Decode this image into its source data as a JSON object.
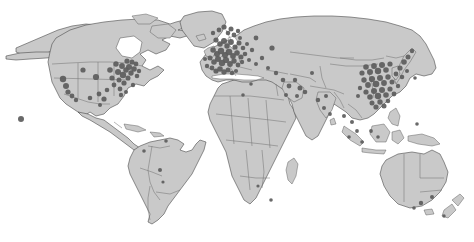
{
  "figure": {
    "type": "dot-distribution-world-map",
    "title": "",
    "caption": "",
    "width": 474,
    "height": 242,
    "projection": "robinson-like",
    "colors": {
      "ocean": "#ffffff",
      "land": "#c9c9c9",
      "country_border": "#6e6e6e",
      "coastline": "#4a4a4a",
      "marker": "#5c5c5c"
    },
    "legend": {
      "visible": false,
      "entries": []
    },
    "axes": {
      "visible": false
    },
    "labels": []
  },
  "chart_data": {
    "type": "scatter",
    "title": "",
    "subtitle": "",
    "xlabel": "Longitude",
    "ylabel": "Latitude",
    "xlim": [
      -180,
      180
    ],
    "ylim": [
      -90,
      90
    ],
    "grid": false,
    "legend_position": "none",
    "marker_style": {
      "shape": "circle",
      "color": "#5c5c5c",
      "opacity": 0.92
    },
    "regions": [
      {
        "name": "Western Europe",
        "density": "very-high",
        "approx_count": 120
      },
      {
        "name": "East Asia",
        "density": "very-high",
        "approx_count": 85
      },
      {
        "name": "United States",
        "density": "high",
        "approx_count": 55
      },
      {
        "name": "Middle East",
        "density": "low",
        "approx_count": 8
      },
      {
        "name": "South Asia",
        "density": "low",
        "approx_count": 6
      },
      {
        "name": "Southeast Asia",
        "density": "low",
        "approx_count": 7
      },
      {
        "name": "Australia / Oceania",
        "density": "low",
        "approx_count": 4
      },
      {
        "name": "South America",
        "density": "very-low",
        "approx_count": 4
      },
      {
        "name": "Africa",
        "density": "very-low",
        "approx_count": 3
      },
      {
        "name": "Russia",
        "density": "very-low",
        "approx_count": 2
      }
    ],
    "points": [
      {
        "x": 21,
        "y": 119,
        "r": 3.0
      },
      {
        "x": 63,
        "y": 79,
        "r": 3.2
      },
      {
        "x": 66,
        "y": 86,
        "r": 3.0
      },
      {
        "x": 68,
        "y": 92,
        "r": 2.6
      },
      {
        "x": 72,
        "y": 96,
        "r": 2.4
      },
      {
        "x": 76,
        "y": 100,
        "r": 2.2
      },
      {
        "x": 83,
        "y": 70,
        "r": 2.6
      },
      {
        "x": 90,
        "y": 98,
        "r": 2.3
      },
      {
        "x": 96,
        "y": 77,
        "r": 3.1
      },
      {
        "x": 99,
        "y": 94,
        "r": 2.4
      },
      {
        "x": 104,
        "y": 99,
        "r": 2.6
      },
      {
        "x": 107,
        "y": 90,
        "r": 2.3
      },
      {
        "x": 110,
        "y": 70,
        "r": 2.8
      },
      {
        "x": 112,
        "y": 78,
        "r": 2.6
      },
      {
        "x": 114,
        "y": 85,
        "r": 2.4
      },
      {
        "x": 116,
        "y": 64,
        "r": 2.7
      },
      {
        "x": 118,
        "y": 72,
        "r": 3.0
      },
      {
        "x": 119,
        "y": 80,
        "r": 2.5
      },
      {
        "x": 120,
        "y": 89,
        "r": 2.4
      },
      {
        "x": 122,
        "y": 66,
        "r": 2.9
      },
      {
        "x": 123,
        "y": 75,
        "r": 3.2
      },
      {
        "x": 124,
        "y": 83,
        "r": 2.6
      },
      {
        "x": 126,
        "y": 70,
        "r": 2.8
      },
      {
        "x": 127,
        "y": 61,
        "r": 2.6
      },
      {
        "x": 128,
        "y": 78,
        "r": 2.5
      },
      {
        "x": 129,
        "y": 67,
        "r": 3.0
      },
      {
        "x": 131,
        "y": 73,
        "r": 2.7
      },
      {
        "x": 132,
        "y": 62,
        "r": 2.5
      },
      {
        "x": 133,
        "y": 85,
        "r": 2.2
      },
      {
        "x": 134,
        "y": 69,
        "r": 2.8
      },
      {
        "x": 136,
        "y": 64,
        "r": 2.4
      },
      {
        "x": 137,
        "y": 76,
        "r": 2.3
      },
      {
        "x": 139,
        "y": 71,
        "r": 2.2
      },
      {
        "x": 121,
        "y": 95,
        "r": 2.2
      },
      {
        "x": 126,
        "y": 92,
        "r": 2.0
      },
      {
        "x": 100,
        "y": 105,
        "r": 2.0
      },
      {
        "x": 144,
        "y": 151,
        "r": 1.8
      },
      {
        "x": 160,
        "y": 170,
        "r": 2.0
      },
      {
        "x": 166,
        "y": 141,
        "r": 1.8
      },
      {
        "x": 163,
        "y": 182,
        "r": 1.6
      },
      {
        "x": 213,
        "y": 33,
        "r": 2.2
      },
      {
        "x": 219,
        "y": 30,
        "r": 2.4
      },
      {
        "x": 224,
        "y": 27,
        "r": 2.6
      },
      {
        "x": 228,
        "y": 33,
        "r": 2.3
      },
      {
        "x": 231,
        "y": 29,
        "r": 2.5
      },
      {
        "x": 234,
        "y": 35,
        "r": 2.4
      },
      {
        "x": 238,
        "y": 31,
        "r": 2.2
      },
      {
        "x": 216,
        "y": 40,
        "r": 2.6
      },
      {
        "x": 220,
        "y": 44,
        "r": 2.8
      },
      {
        "x": 224,
        "y": 41,
        "r": 3.0
      },
      {
        "x": 227,
        "y": 46,
        "r": 2.7
      },
      {
        "x": 231,
        "y": 42,
        "r": 2.9
      },
      {
        "x": 235,
        "y": 47,
        "r": 2.6
      },
      {
        "x": 239,
        "y": 43,
        "r": 2.5
      },
      {
        "x": 243,
        "y": 48,
        "r": 2.3
      },
      {
        "x": 213,
        "y": 50,
        "r": 2.7
      },
      {
        "x": 217,
        "y": 54,
        "r": 3.0
      },
      {
        "x": 221,
        "y": 51,
        "r": 3.2
      },
      {
        "x": 225,
        "y": 55,
        "r": 3.1
      },
      {
        "x": 229,
        "y": 52,
        "r": 3.3
      },
      {
        "x": 233,
        "y": 56,
        "r": 2.9
      },
      {
        "x": 237,
        "y": 53,
        "r": 2.8
      },
      {
        "x": 241,
        "y": 57,
        "r": 2.5
      },
      {
        "x": 245,
        "y": 54,
        "r": 2.3
      },
      {
        "x": 210,
        "y": 58,
        "r": 2.5
      },
      {
        "x": 214,
        "y": 62,
        "r": 2.8
      },
      {
        "x": 218,
        "y": 59,
        "r": 3.0
      },
      {
        "x": 222,
        "y": 63,
        "r": 3.2
      },
      {
        "x": 226,
        "y": 60,
        "r": 3.1
      },
      {
        "x": 230,
        "y": 64,
        "r": 2.9
      },
      {
        "x": 234,
        "y": 61,
        "r": 2.7
      },
      {
        "x": 238,
        "y": 65,
        "r": 2.4
      },
      {
        "x": 242,
        "y": 62,
        "r": 2.2
      },
      {
        "x": 212,
        "y": 68,
        "r": 2.4
      },
      {
        "x": 216,
        "y": 71,
        "r": 2.6
      },
      {
        "x": 220,
        "y": 69,
        "r": 2.8
      },
      {
        "x": 224,
        "y": 72,
        "r": 2.7
      },
      {
        "x": 228,
        "y": 70,
        "r": 2.5
      },
      {
        "x": 232,
        "y": 73,
        "r": 2.3
      },
      {
        "x": 236,
        "y": 71,
        "r": 2.1
      },
      {
        "x": 207,
        "y": 66,
        "r": 2.2
      },
      {
        "x": 205,
        "y": 59,
        "r": 2.0
      },
      {
        "x": 240,
        "y": 38,
        "r": 2.0
      },
      {
        "x": 247,
        "y": 44,
        "r": 2.0
      },
      {
        "x": 252,
        "y": 50,
        "r": 2.2
      },
      {
        "x": 256,
        "y": 38,
        "r": 2.4
      },
      {
        "x": 249,
        "y": 60,
        "r": 2.0
      },
      {
        "x": 256,
        "y": 64,
        "r": 2.0
      },
      {
        "x": 262,
        "y": 58,
        "r": 2.2
      },
      {
        "x": 272,
        "y": 48,
        "r": 2.6
      },
      {
        "x": 268,
        "y": 68,
        "r": 2.0
      },
      {
        "x": 276,
        "y": 73,
        "r": 2.2
      },
      {
        "x": 283,
        "y": 80,
        "r": 2.3
      },
      {
        "x": 289,
        "y": 86,
        "r": 2.4
      },
      {
        "x": 295,
        "y": 80,
        "r": 2.2
      },
      {
        "x": 300,
        "y": 88,
        "r": 2.5
      },
      {
        "x": 305,
        "y": 92,
        "r": 2.3
      },
      {
        "x": 297,
        "y": 96,
        "r": 2.0
      },
      {
        "x": 286,
        "y": 95,
        "r": 2.0
      },
      {
        "x": 312,
        "y": 73,
        "r": 2.0
      },
      {
        "x": 318,
        "y": 100,
        "r": 2.2
      },
      {
        "x": 324,
        "y": 108,
        "r": 2.0
      },
      {
        "x": 330,
        "y": 114,
        "r": 1.9
      },
      {
        "x": 326,
        "y": 96,
        "r": 2.0
      },
      {
        "x": 344,
        "y": 116,
        "r": 2.0
      },
      {
        "x": 352,
        "y": 122,
        "r": 2.0
      },
      {
        "x": 357,
        "y": 131,
        "r": 1.9
      },
      {
        "x": 349,
        "y": 137,
        "r": 1.8
      },
      {
        "x": 362,
        "y": 142,
        "r": 1.8
      },
      {
        "x": 371,
        "y": 131,
        "r": 1.9
      },
      {
        "x": 378,
        "y": 137,
        "r": 1.8
      },
      {
        "x": 362,
        "y": 73,
        "r": 2.6
      },
      {
        "x": 366,
        "y": 67,
        "r": 2.8
      },
      {
        "x": 370,
        "y": 72,
        "r": 3.0
      },
      {
        "x": 374,
        "y": 66,
        "r": 2.9
      },
      {
        "x": 378,
        "y": 71,
        "r": 3.2
      },
      {
        "x": 382,
        "y": 65,
        "r": 3.0
      },
      {
        "x": 386,
        "y": 70,
        "r": 2.8
      },
      {
        "x": 390,
        "y": 64,
        "r": 2.6
      },
      {
        "x": 364,
        "y": 80,
        "r": 2.7
      },
      {
        "x": 368,
        "y": 85,
        "r": 2.9
      },
      {
        "x": 372,
        "y": 79,
        "r": 3.1
      },
      {
        "x": 376,
        "y": 84,
        "r": 3.3
      },
      {
        "x": 380,
        "y": 78,
        "r": 3.0
      },
      {
        "x": 384,
        "y": 83,
        "r": 2.9
      },
      {
        "x": 388,
        "y": 77,
        "r": 2.7
      },
      {
        "x": 392,
        "y": 82,
        "r": 2.5
      },
      {
        "x": 366,
        "y": 92,
        "r": 2.6
      },
      {
        "x": 370,
        "y": 97,
        "r": 2.8
      },
      {
        "x": 374,
        "y": 91,
        "r": 3.0
      },
      {
        "x": 378,
        "y": 96,
        "r": 3.2
      },
      {
        "x": 382,
        "y": 90,
        "r": 3.0
      },
      {
        "x": 386,
        "y": 95,
        "r": 2.8
      },
      {
        "x": 390,
        "y": 89,
        "r": 2.6
      },
      {
        "x": 394,
        "y": 94,
        "r": 2.4
      },
      {
        "x": 372,
        "y": 103,
        "r": 2.5
      },
      {
        "x": 376,
        "y": 107,
        "r": 2.6
      },
      {
        "x": 380,
        "y": 102,
        "r": 2.7
      },
      {
        "x": 384,
        "y": 106,
        "r": 2.5
      },
      {
        "x": 388,
        "y": 101,
        "r": 2.3
      },
      {
        "x": 360,
        "y": 88,
        "r": 2.2
      },
      {
        "x": 358,
        "y": 96,
        "r": 2.0
      },
      {
        "x": 396,
        "y": 74,
        "r": 2.4
      },
      {
        "x": 400,
        "y": 68,
        "r": 2.6
      },
      {
        "x": 404,
        "y": 62,
        "r": 2.8
      },
      {
        "x": 408,
        "y": 57,
        "r": 2.5
      },
      {
        "x": 402,
        "y": 77,
        "r": 2.3
      },
      {
        "x": 398,
        "y": 86,
        "r": 2.2
      },
      {
        "x": 412,
        "y": 51,
        "r": 2.2
      },
      {
        "x": 407,
        "y": 71,
        "r": 2.0
      },
      {
        "x": 415,
        "y": 78,
        "r": 1.8
      },
      {
        "x": 417,
        "y": 124,
        "r": 1.8
      },
      {
        "x": 421,
        "y": 203,
        "r": 2.2
      },
      {
        "x": 432,
        "y": 197,
        "r": 2.0
      },
      {
        "x": 414,
        "y": 208,
        "r": 1.8
      },
      {
        "x": 444,
        "y": 216,
        "r": 1.7
      },
      {
        "x": 271,
        "y": 200,
        "r": 1.8
      },
      {
        "x": 258,
        "y": 186,
        "r": 1.6
      },
      {
        "x": 243,
        "y": 95,
        "r": 1.8
      },
      {
        "x": 251,
        "y": 84,
        "r": 1.8
      }
    ]
  }
}
